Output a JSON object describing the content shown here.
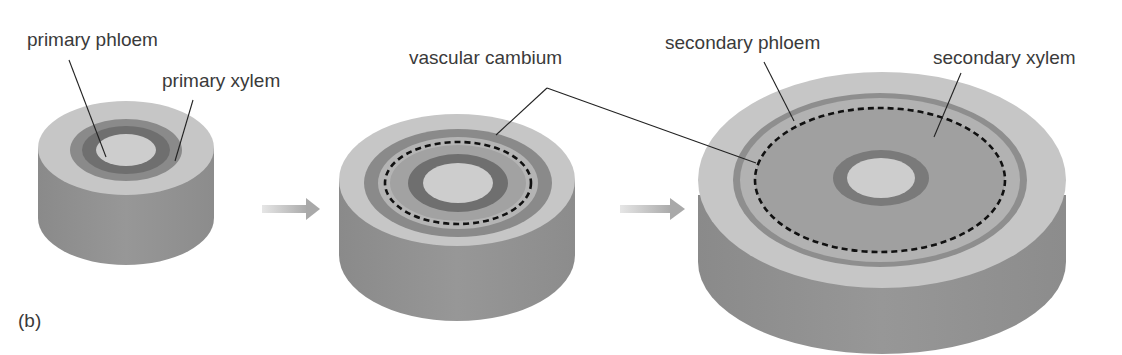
{
  "figure": {
    "panel_label": "(b)"
  },
  "colors": {
    "outer_tissue": "#c6c6c6",
    "side_wall": "#8e8e8e",
    "primary_phloem": "#8a8a8a",
    "primary_xylem": "#6f6f6f",
    "secondary_xylem": "#a2a2a2",
    "secondary_phloem_band": "#b4b4b4",
    "pith": "#cdcdcd",
    "arrow": "#b0b0b0",
    "cambium_dash": "#111111",
    "leader_line": "#222222"
  },
  "stages": [
    {
      "id": "stage-1",
      "name": "primary growth"
    },
    {
      "id": "stage-2",
      "name": "vascular cambium forms"
    },
    {
      "id": "stage-3",
      "name": "secondary growth"
    }
  ],
  "labels": {
    "primary_phloem": "primary phloem",
    "primary_xylem": "primary xylem",
    "vascular_cambium": "vascular cambium",
    "secondary_phloem": "secondary phloem",
    "secondary_xylem": "secondary xylem"
  }
}
